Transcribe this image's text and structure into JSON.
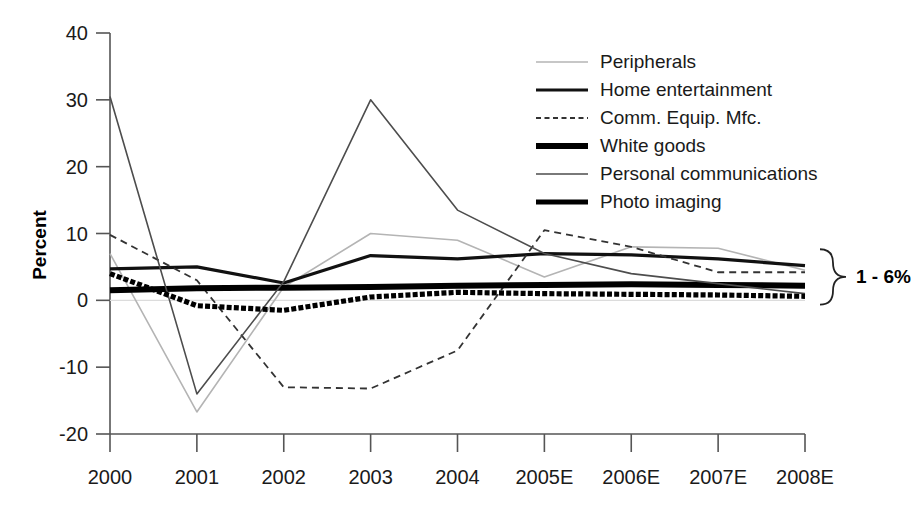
{
  "chart_data": {
    "type": "line",
    "title": "",
    "xlabel": "",
    "ylabel": "Percent",
    "categories": [
      "2000",
      "2001",
      "2002",
      "2003",
      "2004",
      "2005E",
      "2006E",
      "2007E",
      "2008E"
    ],
    "ylim": [
      -20,
      40
    ],
    "yticks": [
      -20,
      -10,
      0,
      10,
      20,
      30,
      40
    ],
    "ytick_labels": [
      "-20",
      "-10",
      "0",
      "10",
      "20",
      "30",
      "40"
    ],
    "grid": false,
    "legend_position": "top-right",
    "series": [
      {
        "name": "Peripherals",
        "style": "solid-thin-light",
        "color": "#b4b4b4",
        "width": 1.6,
        "values": [
          7.0,
          -16.7,
          2.0,
          10.0,
          9.0,
          3.5,
          8.0,
          7.8,
          4.5
        ]
      },
      {
        "name": "Home entertainment",
        "style": "solid-medium",
        "color": "#111111",
        "width": 3.2,
        "values": [
          4.7,
          5.0,
          2.6,
          6.7,
          6.2,
          7.0,
          6.8,
          6.2,
          5.2
        ]
      },
      {
        "name": "Comm. Equip. Mfc.",
        "style": "dashed-thin",
        "color": "#333333",
        "width": 1.8,
        "values": [
          9.8,
          3.0,
          -13.0,
          -13.2,
          -7.5,
          10.5,
          8.0,
          4.2,
          4.2
        ]
      },
      {
        "name": "White goods",
        "style": "solid-thick",
        "color": "#000000",
        "width": 6.0,
        "values": [
          1.5,
          1.8,
          1.9,
          2.0,
          2.2,
          2.3,
          2.4,
          2.3,
          2.2
        ]
      },
      {
        "name": "Personal communications",
        "style": "solid-thin",
        "color": "#4d4d4d",
        "width": 1.6,
        "values": [
          30.5,
          -14.0,
          2.8,
          30.0,
          13.5,
          7.0,
          4.0,
          2.5,
          1.0
        ]
      },
      {
        "name": "Photo imaging",
        "style": "solid-thick-dotted",
        "color": "#000000",
        "width": 5.2,
        "values": [
          4.0,
          -0.8,
          -1.5,
          0.5,
          1.2,
          1.0,
          0.9,
          0.8,
          0.6
        ]
      }
    ],
    "annotations": [
      {
        "text": "1 - 6%",
        "kind": "brace-range",
        "range": [
          1,
          6
        ],
        "at_x": "2008E"
      }
    ]
  },
  "legend": {
    "entries": [
      {
        "label": "Peripherals"
      },
      {
        "label": "Home entertainment"
      },
      {
        "label": "Comm. Equip. Mfc."
      },
      {
        "label": "White goods"
      },
      {
        "label": "Personal communications"
      },
      {
        "label": "Photo imaging"
      }
    ]
  }
}
